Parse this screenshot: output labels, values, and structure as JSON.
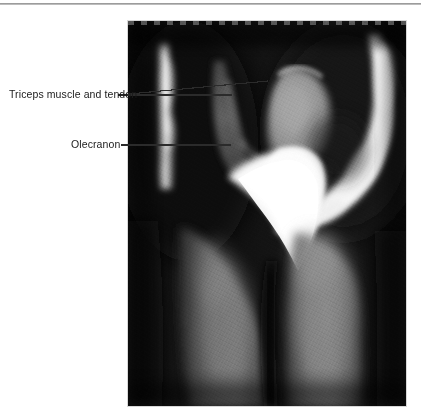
{
  "figure": {
    "modality": "mri",
    "region": "elbow-sagittal",
    "frame": {
      "x": 128,
      "y": 21,
      "width": 278,
      "height": 385
    },
    "background_color": "#0b0b0b"
  },
  "rules": {
    "top_rule_color": "#9a9a9a"
  },
  "annotations": {
    "labels": [
      {
        "id": "triceps",
        "text": "Triceps muscle and tendon",
        "text_x": 9,
        "text_y": 88,
        "leaders": [
          {
            "x1": 118,
            "y1": 95,
            "x2": 232,
            "y2": 95
          },
          {
            "x1": 118,
            "y1": 95,
            "x2": 268,
            "y2": 81
          }
        ]
      },
      {
        "id": "olecranon",
        "text": "Olecranon",
        "text_x": 71,
        "text_y": 138,
        "leaders": [
          {
            "x1": 121,
            "y1": 145,
            "x2": 231,
            "y2": 145
          }
        ]
      }
    ],
    "leader_color": "#2b2b2b",
    "text_color": "#1a1a1a"
  },
  "structures": [
    {
      "name": "subcutaneous-fat-posterior-arc",
      "signal": "bright"
    },
    {
      "name": "triceps-muscle-and-tendon",
      "signal": "intermediate"
    },
    {
      "name": "olecranon",
      "signal": "very-bright"
    },
    {
      "name": "distal-humerus",
      "signal": "intermediate-bright"
    },
    {
      "name": "forearm-muscle-bellies",
      "signal": "intermediate"
    },
    {
      "name": "fascial-plane",
      "signal": "dark"
    }
  ]
}
